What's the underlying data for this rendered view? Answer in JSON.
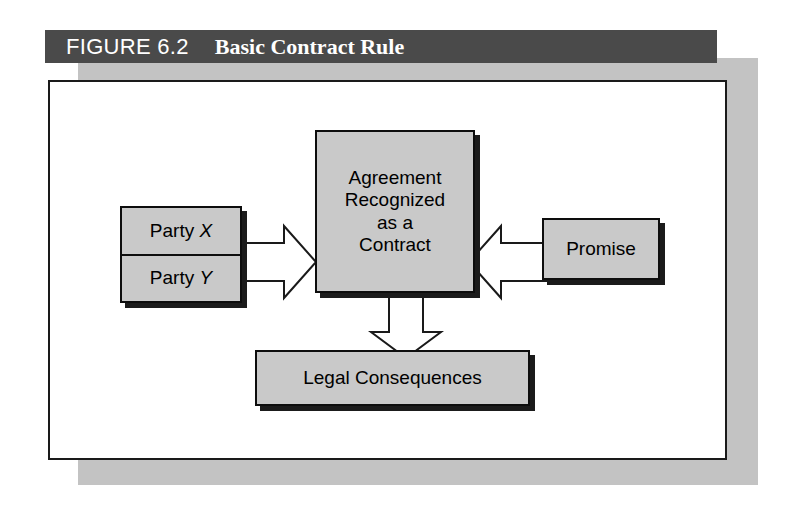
{
  "figure": {
    "label": "FIGURE 6.2",
    "title": "Basic Contract Rule",
    "title_bar_color": "#4a4a4a",
    "title_text_color": "#ffffff",
    "frame_border_color": "#1a1a1a",
    "frame_shadow_color": "#c3c3c3",
    "node_fill_color": "#c9c9c9",
    "node_border_color": "#0d0d0d",
    "arrow_fill_color": "#ffffff",
    "arrow_border_color": "#1a1a1a"
  },
  "diagram": {
    "type": "flow-diagram",
    "nodes": {
      "agreement": {
        "id": "agreement-node",
        "lines": [
          "Agreement",
          "Recognized",
          "as a",
          "Contract"
        ]
      },
      "parties": {
        "id": "parties-node",
        "party_x_prefix": "Party ",
        "party_x_symbol": "X",
        "party_y_prefix": "Party ",
        "party_y_symbol": "Y"
      },
      "promise": {
        "id": "promise-node",
        "label": "Promise"
      },
      "consequences": {
        "id": "legal-consequences-node",
        "label": "Legal Consequences"
      }
    },
    "arrows": [
      {
        "id": "parties-to-agreement",
        "from": "parties",
        "to": "agreement",
        "direction": "right",
        "style": "hollow-block-arrow"
      },
      {
        "id": "promise-to-agreement",
        "from": "promise",
        "to": "agreement",
        "direction": "left",
        "style": "hollow-block-arrow"
      },
      {
        "id": "agreement-to-consequences",
        "from": "agreement",
        "to": "consequences",
        "direction": "down",
        "style": "hollow-block-arrow"
      }
    ]
  }
}
